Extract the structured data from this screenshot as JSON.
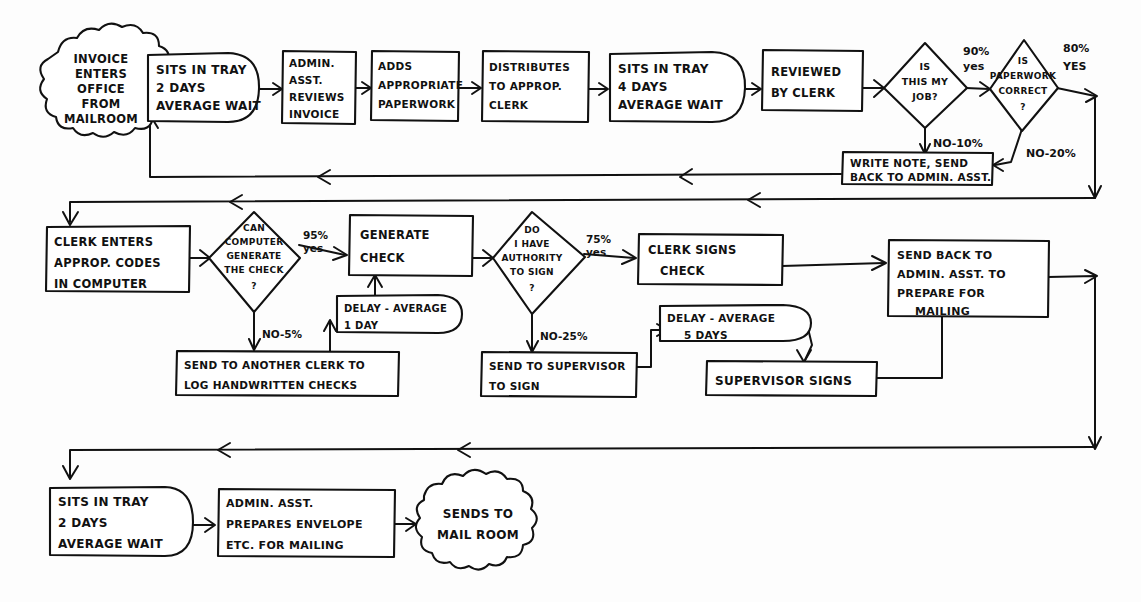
{
  "diagram": {
    "ink_color": "#111111",
    "paper_color": "#fdfdfd"
  },
  "nodes": {
    "start_cloud": {
      "shape": "cloud",
      "lines": [
        "INVOICE",
        "ENTERS",
        "OFFICE",
        "FROM",
        "MAILROOM"
      ]
    },
    "sits_tray_2days_top": {
      "shape": "delay",
      "lines": [
        "SITS IN TRAY",
        "2 DAYS",
        "AVERAGE WAIT"
      ]
    },
    "admin_reviews": {
      "shape": "process",
      "lines": [
        "ADMIN.",
        "ASST.",
        "REVIEWS",
        "INVOICE"
      ]
    },
    "adds_paperwork": {
      "shape": "process",
      "lines": [
        "ADDS",
        "APPROPRIATE",
        "PAPERWORK"
      ]
    },
    "distributes": {
      "shape": "process",
      "lines": [
        "DISTRIBUTES",
        "TO APPROP.",
        "CLERK"
      ]
    },
    "sits_tray_4days": {
      "shape": "delay",
      "lines": [
        "SITS IN TRAY",
        "4 DAYS",
        "AVERAGE WAIT"
      ]
    },
    "reviewed_by_clerk": {
      "shape": "process",
      "lines": [
        "REVIEWED",
        "BY CLERK"
      ]
    },
    "is_this_my_job": {
      "shape": "decision",
      "lines": [
        "IS",
        "THIS MY",
        "JOB?"
      ]
    },
    "is_paperwork_correct": {
      "shape": "decision",
      "lines": [
        "IS",
        "PAPERWORK",
        "CORRECT",
        "?"
      ]
    },
    "write_note": {
      "shape": "process",
      "lines": [
        "WRITE NOTE, SEND",
        "BACK TO ADMIN. ASST."
      ]
    },
    "clerk_enters_codes": {
      "shape": "process",
      "lines": [
        "CLERK ENTERS",
        "APPROP. CODES",
        "IN COMPUTER"
      ]
    },
    "can_computer_generate": {
      "shape": "decision",
      "lines": [
        "CAN",
        "COMPUTER",
        "GENERATE",
        "THE CHECK",
        "?"
      ]
    },
    "generate_check": {
      "shape": "process",
      "lines": [
        "GENERATE",
        "CHECK"
      ]
    },
    "delay_1_day": {
      "shape": "delay",
      "lines": [
        "DELAY - AVERAGE",
        "1 DAY"
      ]
    },
    "send_another_clerk": {
      "shape": "process",
      "lines": [
        "SEND TO ANOTHER CLERK TO",
        "LOG HANDWRITTEN CHECKS"
      ]
    },
    "do_i_have_authority": {
      "shape": "decision",
      "lines": [
        "DO",
        "I HAVE",
        "AUTHORITY",
        "TO SIGN",
        "?"
      ]
    },
    "clerk_signs_check": {
      "shape": "process",
      "lines": [
        "CLERK SIGNS",
        "CHECK"
      ]
    },
    "send_to_supervisor": {
      "shape": "process",
      "lines": [
        "SEND TO SUPERVISOR",
        "TO SIGN"
      ]
    },
    "delay_5_days": {
      "shape": "delay",
      "lines": [
        "DELAY - AVERAGE",
        "5 DAYS"
      ]
    },
    "supervisor_signs": {
      "shape": "process",
      "lines": [
        "SUPERVISOR SIGNS"
      ]
    },
    "send_back_prepare_mailing": {
      "shape": "process",
      "lines": [
        "SEND BACK TO",
        "ADMIN. ASST. TO",
        "PREPARE FOR",
        "MAILING"
      ]
    },
    "sits_tray_2days_bottom": {
      "shape": "delay",
      "lines": [
        "SITS IN TRAY",
        "2 DAYS",
        "AVERAGE WAIT"
      ]
    },
    "admin_prepares_envelope": {
      "shape": "process",
      "lines": [
        "ADMIN. ASST.",
        "PREPARES ENVELOPE",
        "ETC. FOR MAILING"
      ]
    },
    "sends_to_mail_room": {
      "shape": "cloud",
      "lines": [
        "SENDS TO",
        "MAIL ROOM"
      ]
    }
  },
  "edge_labels": {
    "job_yes": [
      "90%",
      "yes"
    ],
    "job_no": "NO-10%",
    "paperwork_yes": [
      "80%",
      "YES"
    ],
    "paperwork_no": "NO-20%",
    "computer_yes": [
      "95%",
      "yes"
    ],
    "computer_no": "NO-5%",
    "authority_yes": [
      "75%",
      "yes"
    ],
    "authority_no": "NO-25%"
  },
  "flow_sequence": [
    "INVOICE ENTERS OFFICE FROM MAILROOM",
    "SITS IN TRAY 2 DAYS AVERAGE WAIT",
    "ADMIN. ASST. REVIEWS INVOICE",
    "ADDS APPROPRIATE PAPERWORK",
    "DISTRIBUTES TO APPROP. CLERK",
    "SITS IN TRAY 4 DAYS AVERAGE WAIT",
    "REVIEWED BY CLERK",
    "IS THIS MY JOB?",
    "IS PAPERWORK CORRECT?",
    "CLERK ENTERS APPROP. CODES IN COMPUTER",
    "CAN COMPUTER GENERATE THE CHECK?",
    "GENERATE CHECK",
    "DO I HAVE AUTHORITY TO SIGN?",
    "CLERK SIGNS CHECK",
    "SEND BACK TO ADMIN. ASST. TO PREPARE FOR MAILING",
    "SITS IN TRAY 2 DAYS AVERAGE WAIT",
    "ADMIN. ASST. PREPARES ENVELOPE ETC. FOR MAILING",
    "SENDS TO MAIL ROOM"
  ]
}
